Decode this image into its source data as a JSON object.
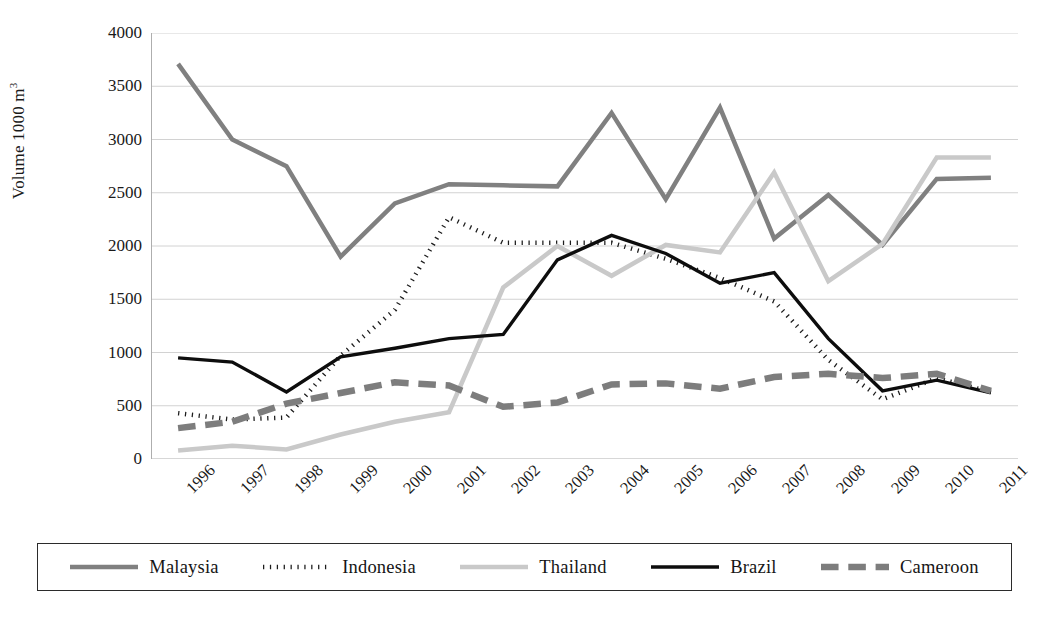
{
  "chart_data": {
    "type": "line",
    "title": "",
    "xlabel": "",
    "ylabel": "Volume 1000 m",
    "ylabel_sup": "3",
    "ylim": [
      0,
      4000
    ],
    "ytick_step": 500,
    "yticks": [
      "4000",
      "3500",
      "3000",
      "2500",
      "2000",
      "1500",
      "1000",
      "500",
      "0"
    ],
    "grid": "horizontal",
    "legend_position": "bottom",
    "categories": [
      "1996",
      "1997",
      "1998",
      "1999",
      "2000",
      "2001",
      "2002",
      "2003",
      "2004",
      "2005",
      "2006",
      "2007",
      "2008",
      "2009",
      "2010",
      "2011"
    ],
    "series": [
      {
        "name": "Malaysia",
        "color": "#808080",
        "style": "solid",
        "width": 4.5,
        "values": [
          3710,
          3000,
          2750,
          1900,
          2400,
          2580,
          2570,
          2560,
          3250,
          2440,
          3300,
          2070,
          2480,
          2010,
          2630,
          2640
        ]
      },
      {
        "name": "Indonesia",
        "color": "#1c1c1c",
        "style": "dotted",
        "width": 4.5,
        "values": [
          430,
          370,
          390,
          970,
          1400,
          2270,
          2030,
          2030,
          2030,
          1880,
          1700,
          1480,
          930,
          560,
          760,
          630
        ]
      },
      {
        "name": "Thailand",
        "color": "#c9c9c9",
        "style": "solid",
        "width": 4.5,
        "values": [
          80,
          125,
          90,
          230,
          350,
          440,
          1610,
          2000,
          1720,
          2010,
          1940,
          2690,
          1670,
          2020,
          2830,
          2830
        ]
      },
      {
        "name": "Brazil",
        "color": "#0d0d0d",
        "style": "solid",
        "width": 3.4,
        "values": [
          950,
          910,
          630,
          960,
          1040,
          1130,
          1170,
          1870,
          2100,
          1930,
          1650,
          1750,
          1130,
          640,
          740,
          620
        ]
      },
      {
        "name": "Cameroon",
        "color": "#7d7d7d",
        "style": "dashed",
        "width": 6.5,
        "values": [
          290,
          350,
          520,
          620,
          720,
          690,
          490,
          530,
          700,
          710,
          660,
          770,
          800,
          760,
          800,
          640
        ]
      }
    ]
  },
  "legend": {
    "items": [
      {
        "label": "Malaysia"
      },
      {
        "label": "Indonesia"
      },
      {
        "label": "Thailand"
      },
      {
        "label": "Brazil"
      },
      {
        "label": "Cameroon"
      }
    ]
  },
  "colors": {
    "axis": "#aeaeae",
    "grid": "#d2d2d2",
    "text": "#1a1a1a",
    "legend_border": "#2b2b2b",
    "background": "#ffffff"
  }
}
